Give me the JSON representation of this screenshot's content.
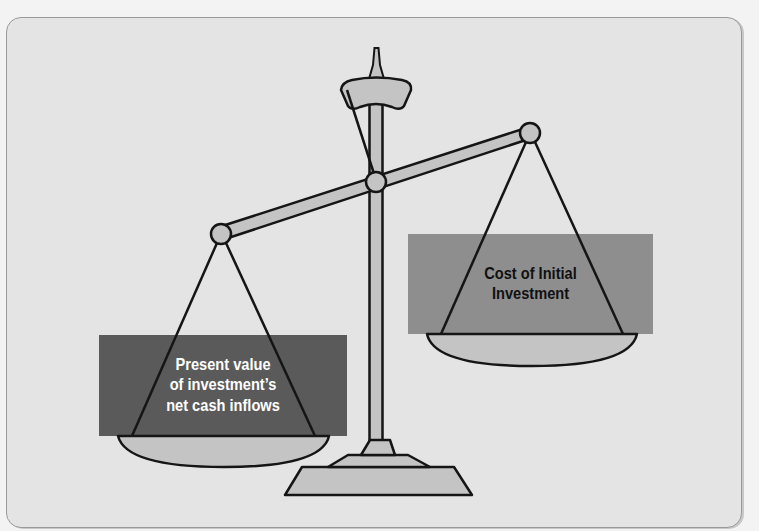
{
  "diagram": {
    "type": "balance-scale",
    "left_pan": {
      "lines": [
        "Present value",
        "of investment’s",
        "net cash inflows"
      ],
      "box_color": "#5a5a5a",
      "text_color": "#ffffff"
    },
    "right_pan": {
      "lines": [
        "Cost of Initial",
        "Investment"
      ],
      "box_color": "#8e8e8e",
      "text_color": "#111111"
    },
    "colors": {
      "panel_background": "#e4e4e4",
      "page_background": "#f3f3f3",
      "scale_fill": "#c4c4c4",
      "outline": "#151515"
    }
  }
}
